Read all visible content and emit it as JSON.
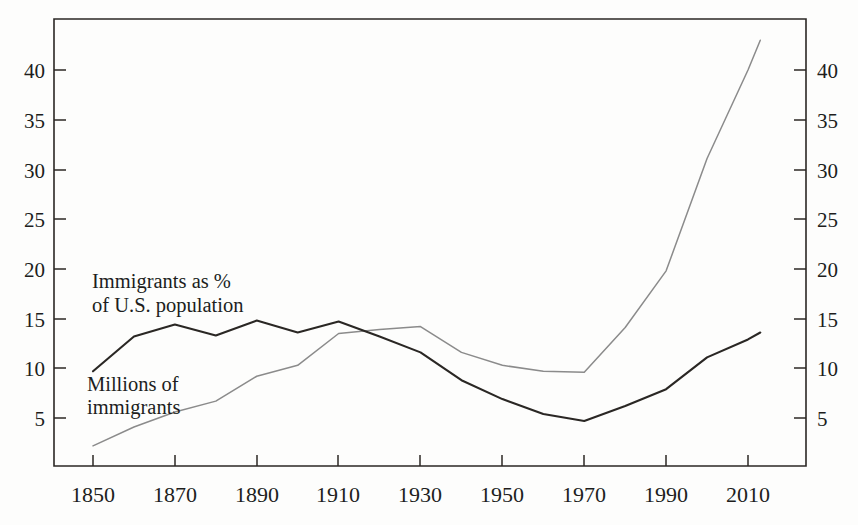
{
  "figure": {
    "background_color": "#fdfdfc",
    "frame_color": "#2b2724"
  },
  "chart_data": {
    "type": "line",
    "title": "",
    "subtitle": "",
    "xlabel": "",
    "ylabel": "",
    "xlim": [
      1845,
      2016
    ],
    "ylim": [
      0,
      45
    ],
    "grid": false,
    "legend_position": "inline-annotations",
    "x_tick_labels": [
      "1850",
      "1870",
      "1890",
      "1910",
      "1930",
      "1950",
      "1970",
      "1990",
      "2010"
    ],
    "x_ticks": [
      1850,
      1870,
      1890,
      1910,
      1930,
      1950,
      1970,
      1990,
      2010
    ],
    "y_tick_labels_left": [
      "5",
      "10",
      "15",
      "20",
      "25",
      "30",
      "35",
      "40"
    ],
    "y_tick_labels_right": [
      "5",
      "10",
      "15",
      "20",
      "25",
      "30",
      "35",
      "40"
    ],
    "y_ticks": [
      5,
      10,
      15,
      20,
      25,
      30,
      35,
      40
    ],
    "dual_axis": true,
    "series": [
      {
        "name": "Immigrants as % of U.S. population",
        "color": "#2a2724",
        "x": [
          1850,
          1860,
          1870,
          1880,
          1890,
          1900,
          1910,
          1920,
          1930,
          1940,
          1950,
          1960,
          1970,
          1980,
          1990,
          2000,
          2010,
          2013
        ],
        "values": [
          9.7,
          13.2,
          14.4,
          13.3,
          14.8,
          13.6,
          14.7,
          13.2,
          11.6,
          8.8,
          6.9,
          5.4,
          4.7,
          6.2,
          7.9,
          11.1,
          12.9,
          13.6
        ]
      },
      {
        "name": "Millions of immigrants",
        "color": "#8b8b8b",
        "x": [
          1850,
          1860,
          1870,
          1880,
          1890,
          1900,
          1910,
          1920,
          1930,
          1940,
          1950,
          1960,
          1970,
          1980,
          1990,
          2000,
          2010,
          2013
        ],
        "values": [
          2.2,
          4.1,
          5.6,
          6.7,
          9.2,
          10.3,
          13.5,
          13.9,
          14.2,
          11.6,
          10.3,
          9.7,
          9.6,
          14.1,
          19.8,
          31.1,
          40.0,
          43.0
        ]
      }
    ],
    "annotations": [
      {
        "name": "percent-series-label",
        "line1": "Immigrants as %",
        "line2": "of U.S. population",
        "x": 1853,
        "y": 21.0
      },
      {
        "name": "millions-series-label",
        "line1": "Millions of",
        "line2": "immigrants",
        "x": 1853,
        "y": 11.0
      }
    ]
  }
}
